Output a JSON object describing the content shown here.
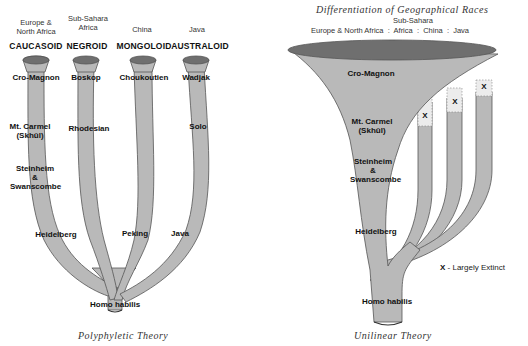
{
  "left_diagram": {
    "title": "Polyphyletic Theory",
    "columns": [
      {
        "region": "Europe & North Africa",
        "region_line1": "Europe &",
        "region_line2": "North Africa",
        "race": "CAUCASOID",
        "top_fossil": "Cro-Magnon"
      },
      {
        "region": "Sub-Sahara Africa",
        "region_line1": "Sub-Sahara",
        "region_line2": "Africa",
        "race": "NEGROID",
        "top_fossil": "Boskop"
      },
      {
        "region": "China",
        "region_line1": "China",
        "region_line2": "",
        "race": "MONGOLOID",
        "top_fossil": "Choukoutien"
      },
      {
        "region": "Java",
        "region_line1": "Java",
        "region_line2": "",
        "race": "AUSTRALOID",
        "top_fossil": "Wadjak"
      }
    ],
    "fossils": {
      "mt_carmel_1": "Mt. Carmel",
      "mt_carmel_2": "(Skhūl)",
      "rhodesian": "Rhodesian",
      "solo": "Solo",
      "steinheim": "Steinheim",
      "amp": "&",
      "swanscombe": "Swanscombe",
      "heidelberg": "Heidelberg",
      "peking": "Peking",
      "java": "Java",
      "homo_habilis": "Homo habilis"
    }
  },
  "right_diagram": {
    "title": "Unilinear Theory",
    "header_title": "Differentiation of Geographical Races",
    "header_sub": "Sub-Sahara",
    "header_regions": "Europe & North Africa  :  Africa  :  China  :  Java",
    "fossils": {
      "cro_magnon": "Cro-Magnon",
      "mt_carmel_1": "Mt. Carmel",
      "mt_carmel_2": "(Skhūl)",
      "steinheim": "Steinheim",
      "amp": "&",
      "swanscombe": "Swanscombe",
      "heidelberg": "Heidelberg",
      "homo_habilis": "Homo habilis"
    },
    "extinct_marker": "X",
    "legend": {
      "marker": "X",
      "text": "- Largely Extinct"
    }
  },
  "colors": {
    "trunk": "#b9b9b9",
    "trunk_top": "#6f6f6f",
    "outline": "#444444",
    "extinct_fill": "#ececec"
  }
}
